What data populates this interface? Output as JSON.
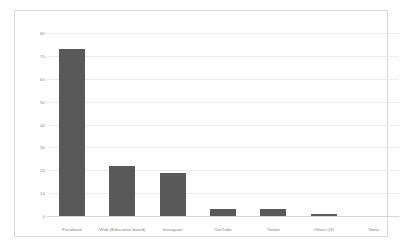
{
  "chart_data": {
    "type": "bar",
    "title": "",
    "subtitle": "",
    "xlabel": "",
    "ylabel": "",
    "categories": [
      "Facebook",
      "Web (Education board)",
      "Instagram",
      "YouTube",
      "Twitter",
      "Others (3)",
      "None"
    ],
    "values": [
      73,
      22,
      19,
      3,
      3,
      1,
      0
    ],
    "ylim": [
      0,
      80
    ],
    "yticks": [
      0,
      10,
      20,
      30,
      40,
      50,
      60,
      70,
      80
    ],
    "ytick_labels": [
      "0",
      "10",
      "20",
      "30",
      "40",
      "50",
      "60",
      "70",
      "80"
    ],
    "grid": true,
    "legend": false,
    "legend_position": "none",
    "bar_color": "#595959",
    "gridline_color": "#ebebeb",
    "axis_color": "#d6d6d6",
    "tick_label_color": "#8c8c8c",
    "frame_color": "#d9d9d9",
    "background_color": "#ffffff"
  }
}
